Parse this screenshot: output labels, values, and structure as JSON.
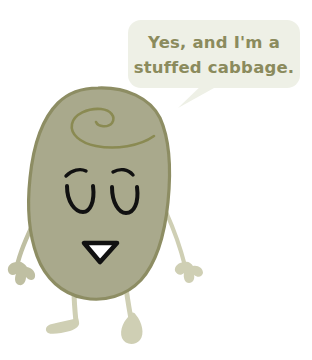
{
  "scene": {
    "title": "Stuffed cabbage character illustration",
    "background_color": "#ffffff",
    "width": 312,
    "height": 360
  },
  "speech_bubble": {
    "name": "speech-bubble",
    "fill_color": "#eef0e6",
    "text_color": "#8b8b5d",
    "lines": [
      "Yes, and I'm a",
      "stuffed cabbage."
    ],
    "full_text": "Yes, and I'm a stuffed cabbage.",
    "tail_direction": "down-left"
  },
  "character": {
    "name": "cabbage-character",
    "body_fill": "#a9a98c",
    "body_outline": "#8d8d63",
    "limb_color": "#c8c8ab",
    "limb_outline": "#a5a583",
    "detail_line_color": "#8a8a52",
    "face": {
      "eye_color": "#111111",
      "eye_style": "closed-happy-u",
      "brow_color": "#111111",
      "mouth_outline": "#111111",
      "mouth_fill": "#ffffff",
      "mouth_shape": "downward-triangle"
    },
    "parts": {
      "head_swirl": "cabbage-leaf-swirl",
      "left_arm": "left-arm",
      "right_arm": "right-arm",
      "left_leg": "left-leg-bent",
      "right_leg": "right-leg-straight"
    }
  }
}
